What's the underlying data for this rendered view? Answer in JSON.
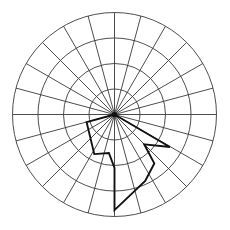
{
  "chart_data": {
    "type": "line",
    "subtype": "polar-radar",
    "title": "",
    "subtitle": "",
    "xlabel": "",
    "ylabel": "",
    "grid": true,
    "legend_position": "none",
    "tick_labels": [],
    "annotations": [],
    "polar": {
      "center_x": 114.5,
      "center_y": 114.5,
      "outer_radius": 102,
      "num_spokes": 24,
      "spoke_step_deg": 15,
      "num_rings": 4,
      "ring_radii": [
        25.5,
        51,
        76.5,
        102
      ],
      "ring_values": [
        1,
        2,
        3,
        4
      ],
      "zero_angle_deg": 0,
      "angle_direction": "counterclockwise",
      "center_dot": true
    },
    "axis_ranges": {
      "r_min": 0,
      "r_max": 4,
      "theta_min_deg": 0,
      "theta_max_deg": 360
    },
    "categories_deg": [
      195,
      210,
      225,
      240,
      255,
      270,
      285,
      300,
      315,
      330,
      345
    ],
    "series": [
      {
        "name": "series-1",
        "closed": false,
        "color": "#111111",
        "values_r": [
          0,
          1.15,
          2.25,
          1.55,
          2.1,
          3.75,
          2.7,
          2.2,
          1.65,
          2.25,
          0
        ],
        "points_xy": [
          [
            114.5,
            114.5
          ],
          [
            86.6,
            122.1
          ],
          [
            94.3,
            154.1
          ],
          [
            108.9,
            153.0
          ],
          [
            114.5,
            167.9
          ],
          [
            114.5,
            210.1
          ],
          [
            145.2,
            181.0
          ],
          [
            154.3,
            163.4
          ],
          [
            144.2,
            144.3
          ],
          [
            169.9,
            147.0
          ],
          [
            114.5,
            114.5
          ]
        ]
      }
    ]
  },
  "colors": {
    "background": "#ffffff",
    "grid": "#3a3a3a",
    "series": "#111111"
  }
}
